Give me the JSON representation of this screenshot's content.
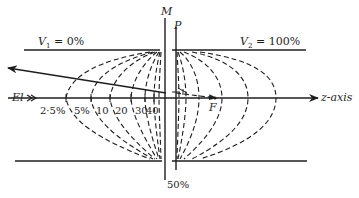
{
  "diagram": {
    "electrodes": {
      "left": {
        "label": "V",
        "subscript": "1",
        "value_text": " = 0%"
      },
      "right": {
        "label": "V",
        "subscript": "2",
        "value_text": " = 100%"
      }
    },
    "planes": {
      "M": "M",
      "P": "P"
    },
    "axis": {
      "label": "z-axis",
      "incoming_label": "El",
      "focus_label": "F"
    },
    "equipotential_labels": [
      "2·5%",
      "5%",
      "10",
      "20",
      "30",
      "40",
      "50%"
    ],
    "colors": {
      "line": "#1e1e1e",
      "background": "#ffffff"
    }
  }
}
